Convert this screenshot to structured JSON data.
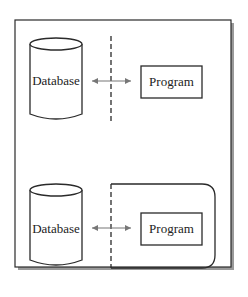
{
  "diagram": {
    "colors": {
      "stroke": "#2a2a2a",
      "arrow": "#777777",
      "shadow": "#9a9a9a",
      "background": "#ffffff"
    },
    "panels": [
      {
        "name": "top",
        "database_label": "Database",
        "program_label": "Program",
        "boundary": "dashed-line"
      },
      {
        "name": "bottom",
        "database_label": "Database",
        "program_label": "Program",
        "boundary": "dashed-rounded-enclosure"
      }
    ]
  }
}
